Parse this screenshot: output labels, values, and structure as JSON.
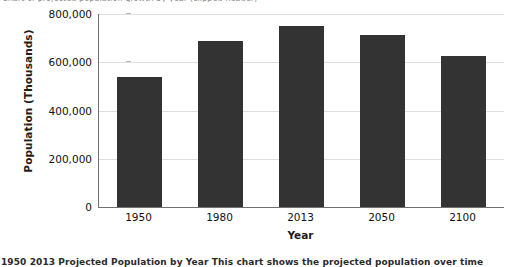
{
  "clipped_text": {
    "top_fragment": "Chart of projected population growth by year (clipped header)",
    "bottom_fragment": "1950 2013 Projected Population by Year   This chart shows the projected population over time"
  },
  "chart_data": {
    "type": "bar",
    "title": "",
    "xlabel": "Year",
    "ylabel": "Population (Thousands)",
    "categories": [
      "1950",
      "1980",
      "2013",
      "2050",
      "2100"
    ],
    "values": [
      540000,
      690000,
      752000,
      712000,
      628000
    ],
    "ylim": [
      0,
      800000
    ],
    "ytick_values": [
      0,
      200000,
      400000,
      600000,
      800000
    ],
    "ytick_labels": [
      "0",
      "200,000",
      "400,000",
      "600,000",
      "800,000"
    ],
    "grid": true,
    "legend": "none",
    "bar_color": "#333333",
    "gridline_color": "#dedede",
    "axis_color": "#6f6f6f",
    "background_color": "#ffffff"
  }
}
